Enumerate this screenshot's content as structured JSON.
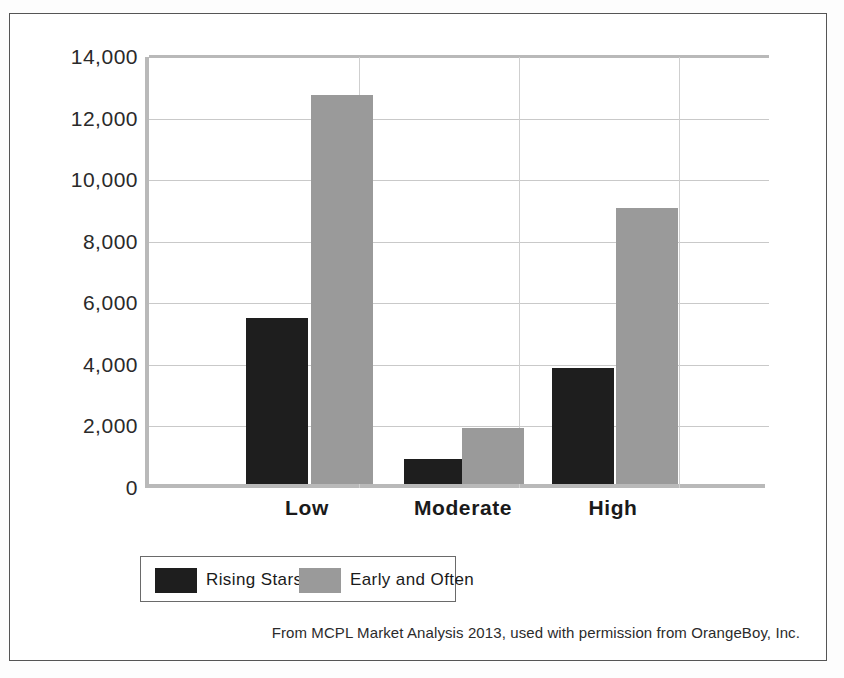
{
  "figure": {
    "caption": "From MCPL Market Analysis 2013, used with permission from OrangeBoy, Inc."
  },
  "legend": {
    "entries": [
      {
        "label": "Rising Stars",
        "color": "#1e1e1e",
        "swatch_name": "legend-swatch-rising-stars"
      },
      {
        "label": "Early and Often",
        "color": "#9a9a9a",
        "swatch_name": "legend-swatch-early-and-often"
      }
    ]
  },
  "axis": {
    "y_ticks": [
      "0",
      "2,000",
      "4,000",
      "6,000",
      "8,000",
      "10,000",
      "12,000",
      "14,000"
    ],
    "x_ticks": [
      "Low",
      "Moderate",
      "High"
    ]
  },
  "chart_data": {
    "type": "bar",
    "title": "",
    "subtitle": "",
    "xlabel": "",
    "ylabel": "",
    "categories": [
      "Low",
      "Moderate",
      "High"
    ],
    "series": [
      {
        "name": "Rising Stars",
        "color": "#1e1e1e",
        "values": [
          5400,
          820,
          3760
        ]
      },
      {
        "name": "Early and Often",
        "color": "#9a9a9a",
        "values": [
          12650,
          1830,
          8950
        ]
      }
    ],
    "ylim": [
      0,
      14000
    ],
    "ytick_step": 2000,
    "ytick_labels": [
      "0",
      "2,000",
      "4,000",
      "6,000",
      "8,000",
      "10,000",
      "12,000",
      "14,000"
    ],
    "grid": true,
    "grid_axis": "both",
    "legend_position": "bottom",
    "annotations": [
      "From MCPL Market Analysis 2013, used with permission from OrangeBoy, Inc."
    ]
  }
}
